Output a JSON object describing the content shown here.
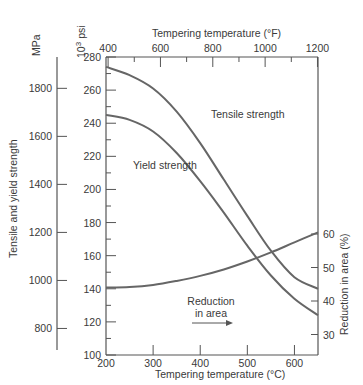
{
  "chart_data": {
    "type": "line",
    "title": "",
    "xlabel": "Tempering temperature (°C)",
    "x2label": "Tempering temperature (°F)",
    "ylabel": "Tensile and yield strength",
    "ylabel_units_left_outer": "MPa",
    "ylabel_units_left_inner": "10³ psi",
    "y2label": "Reduction in area (%)",
    "xlim": [
      200,
      650
    ],
    "ylim": [
      100,
      280
    ],
    "y2lim": [
      25,
      67
    ],
    "x_ticks": [
      "200",
      "300",
      "400",
      "500",
      "600"
    ],
    "x2_ticks": [
      "400",
      "600",
      "800",
      "1000",
      "1200"
    ],
    "y_ticks_psi": [
      "100",
      "120",
      "140",
      "160",
      "180",
      "200",
      "220",
      "240",
      "260",
      "280"
    ],
    "y_ticks_mpa": [
      "800",
      "1000",
      "1200",
      "1400",
      "1600",
      "1800"
    ],
    "y2_ticks": [
      "30",
      "40",
      "50",
      "60"
    ],
    "grid": false,
    "series": [
      {
        "name": "Tensile strength",
        "axis": "left (10³ psi)",
        "x": [
          200,
          250,
          300,
          350,
          400,
          450,
          500,
          550,
          600,
          650
        ],
        "values": [
          274,
          269,
          261,
          247,
          228,
          206,
          184,
          163,
          147,
          140
        ]
      },
      {
        "name": "Yield strength",
        "axis": "left (10³ psi)",
        "x": [
          200,
          250,
          300,
          350,
          400,
          450,
          500,
          550,
          600,
          650
        ],
        "values": [
          245,
          242,
          235,
          222,
          205,
          186,
          166,
          148,
          134,
          124
        ]
      },
      {
        "name": "Reduction in area",
        "axis": "right (%)",
        "x": [
          200,
          250,
          300,
          350,
          400,
          450,
          500,
          550,
          600,
          650
        ],
        "values": [
          44,
          44.2,
          44.8,
          46,
          47.5,
          49.4,
          51.8,
          54.5,
          57.5,
          60.5
        ]
      }
    ],
    "annotations": [
      "Tensile strength",
      "Yield strength",
      "Reduction in area →"
    ]
  },
  "labels": {
    "mpa": "MPa",
    "psi_base": "10",
    "psi_exp": "3",
    "psi_unit": "psi",
    "top_axis": "Tempering temperature (°F)",
    "bottom_axis": "Tempering temperature (°C)",
    "left_axis": "Tensile and yield strength",
    "right_axis": "Reduction in area (%)",
    "tensile": "Tensile strength",
    "yield": "Yield strength",
    "reduction_1": "Reduction",
    "reduction_2": "in area"
  }
}
